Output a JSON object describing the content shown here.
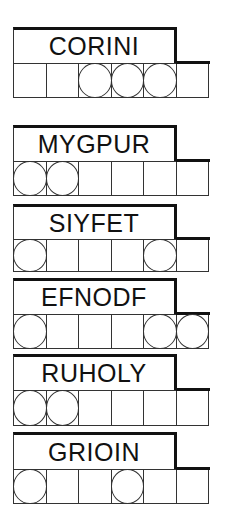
{
  "puzzle": {
    "title_word": {
      "word": "CORINI",
      "circled": [
        false,
        false,
        true,
        true,
        true,
        false
      ]
    },
    "words": [
      {
        "word": "MYGPUR",
        "circled": [
          true,
          true,
          false,
          false,
          false,
          false
        ]
      },
      {
        "word": "SIYFET",
        "circled": [
          true,
          false,
          false,
          false,
          true,
          false
        ]
      },
      {
        "word": "EFNODF",
        "circled": [
          true,
          false,
          false,
          false,
          true,
          true
        ]
      },
      {
        "word": "RUHOLY",
        "circled": [
          true,
          true,
          false,
          false,
          false,
          false
        ]
      },
      {
        "word": "GRIOIN",
        "circled": [
          true,
          false,
          false,
          true,
          false,
          false
        ]
      }
    ]
  },
  "colors": {
    "ink": "#111111",
    "background": "#ffffff"
  }
}
